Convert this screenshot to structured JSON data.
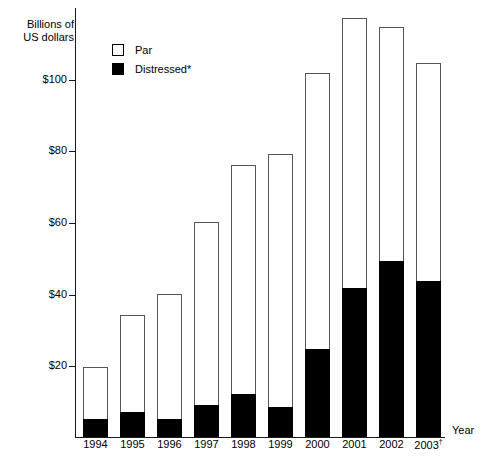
{
  "chart_data": {
    "type": "bar",
    "stacked": true,
    "title": "",
    "subtitle": "",
    "xlabel": "Year",
    "ylabel": "Billions of\nUS dollars",
    "categories": [
      "1994",
      "1995",
      "1996",
      "1997",
      "1998",
      "1999",
      "2000",
      "2001",
      "2002",
      "2003†"
    ],
    "series": [
      {
        "name": "Distressed*",
        "color": "#000000",
        "values": [
          5,
          7,
          5,
          9,
          12,
          8.5,
          24.5,
          41.5,
          49,
          43.5
        ]
      },
      {
        "name": "Par",
        "color": "#ffffff",
        "values": [
          14.5,
          27,
          35,
          51,
          64,
          70.5,
          77,
          75.5,
          65.5,
          61
        ]
      }
    ],
    "totals": [
      19.5,
      34,
      40,
      60,
      76,
      79,
      101.5,
      117,
      114.5,
      104.5
    ],
    "ylim": [
      0,
      120
    ],
    "yticks": [
      20,
      40,
      60,
      80,
      100
    ],
    "ytick_labels": [
      "$20",
      "$40",
      "$60",
      "$80",
      "$100"
    ],
    "grid": false,
    "legend_position": "top-left"
  },
  "legend": {
    "items": [
      {
        "label": "Par",
        "swatch": "open-square-swatch"
      },
      {
        "label": "Distressed*",
        "swatch": "filled-square-swatch"
      }
    ]
  },
  "axes": {
    "y_title": "Billions of\nUS dollars",
    "x_title": "Year"
  }
}
